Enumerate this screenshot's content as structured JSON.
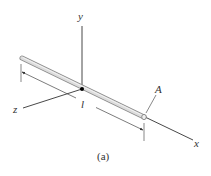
{
  "figure": {
    "caption": "(a)",
    "labels": {
      "y_axis": "y",
      "z_axis": "z",
      "x_axis": "x",
      "length": "l",
      "point_a": "A"
    },
    "colors": {
      "axis": "#333333",
      "rod_fill": "#d9d9d9",
      "rod_edge": "#8c8c8c",
      "origin": "#000000"
    }
  }
}
